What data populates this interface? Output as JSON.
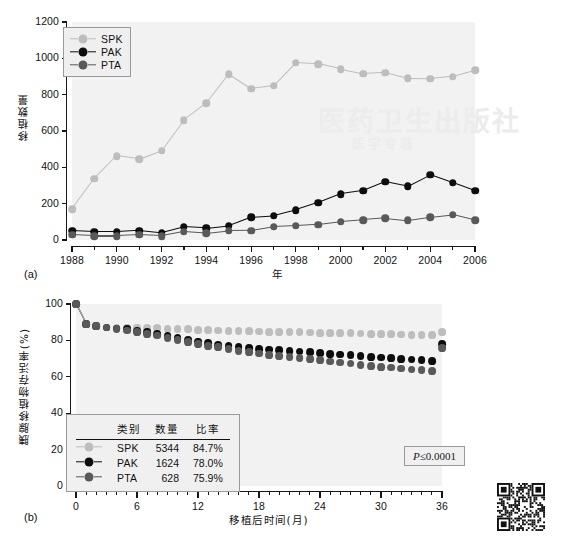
{
  "figure": {
    "panel_a_letter": "(a)",
    "panel_b_letter": "(b)",
    "watermark_primary": "医药卫生出版社",
    "watermark_secondary": "医学专著"
  },
  "colors": {
    "spk": "#bdbdbd",
    "pak": "#0d0d0d",
    "pta": "#595959",
    "plot_bg": "#f2f2f2",
    "axis": "#161616",
    "page_bg": "#ffffff"
  },
  "chart_data": [
    {
      "type": "line",
      "panel": "(a)",
      "title": "",
      "xlabel": "年",
      "ylabel": "移植数量",
      "xlim": [
        1988,
        2006
      ],
      "ylim": [
        0,
        1200
      ],
      "grid": false,
      "legend_position": "top-left",
      "x": [
        1988,
        1989,
        1990,
        1991,
        1992,
        1993,
        1994,
        1995,
        1996,
        1997,
        1998,
        1999,
        2000,
        2001,
        2002,
        2003,
        2004,
        2005,
        2006
      ],
      "xticklabels": [
        "1988",
        "1990",
        "1992",
        "1994",
        "1996",
        "1998",
        "2000",
        "2002",
        "2004",
        "2006"
      ],
      "xtickvalues": [
        1988,
        1990,
        1992,
        1994,
        1996,
        1998,
        2000,
        2002,
        2004,
        2006
      ],
      "yticklabels": [
        "0",
        "200",
        "400",
        "600",
        "800",
        "1000",
        "1200"
      ],
      "ytickvalues": [
        0,
        200,
        400,
        600,
        800,
        1000,
        1200
      ],
      "series": [
        {
          "name": "SPK",
          "color": "#bdbdbd",
          "values": [
            170,
            337,
            462,
            445,
            492,
            660,
            752,
            912,
            832,
            848,
            975,
            968,
            940,
            915,
            922,
            890,
            888,
            900,
            935
          ]
        },
        {
          "name": "PAK",
          "color": "#0d0d0d",
          "values": [
            50,
            45,
            45,
            52,
            40,
            72,
            65,
            78,
            125,
            133,
            165,
            205,
            253,
            270,
            320,
            295,
            358,
            315,
            270
          ]
        },
        {
          "name": "PTA",
          "color": "#595959",
          "values": [
            28,
            22,
            22,
            28,
            22,
            45,
            37,
            50,
            52,
            73,
            78,
            85,
            100,
            110,
            120,
            108,
            125,
            138,
            108
          ]
        }
      ]
    },
    {
      "type": "line",
      "panel": "(b)",
      "title": "",
      "xlabel": "移植后时间(月)",
      "ylabel": "胰腺移植物存活率(%)",
      "xlim": [
        0,
        36
      ],
      "ylim": [
        0,
        100
      ],
      "grid": false,
      "legend_position": "lower-left",
      "annotation": "P≤0.0001",
      "xticklabels": [
        "0",
        "6",
        "12",
        "18",
        "24",
        "30",
        "36"
      ],
      "xtickvalues": [
        0,
        6,
        12,
        18,
        24,
        30,
        36
      ],
      "yticklabels": [
        "0",
        "20",
        "40",
        "60",
        "80",
        "100"
      ],
      "ytickvalues": [
        0,
        20,
        40,
        60,
        80,
        100
      ],
      "x": [
        0,
        1,
        2,
        3,
        4,
        5,
        6,
        7,
        8,
        9,
        10,
        11,
        12,
        13,
        14,
        15,
        16,
        17,
        18,
        19,
        20,
        21,
        22,
        23,
        24,
        25,
        26,
        27,
        28,
        29,
        30,
        31,
        32,
        33,
        34,
        35,
        36
      ],
      "series": [
        {
          "name": "SPK",
          "color": "#bdbdbd",
          "n": 5344,
          "rate_36m": "84.7%",
          "values": [
            100,
            89,
            88,
            87,
            87,
            87,
            87,
            86.8,
            86.6,
            86.4,
            86.2,
            86,
            85.8,
            85.6,
            85.4,
            85.2,
            85,
            85,
            84.8,
            84.7,
            84.6,
            84.5,
            84.4,
            84.3,
            84.2,
            84,
            83.9,
            83.8,
            83.7,
            83.6,
            83.5,
            83.3,
            83.2,
            83,
            82.9,
            82.8,
            84.7
          ]
        },
        {
          "name": "PAK",
          "color": "#0d0d0d",
          "n": 1624,
          "rate_36m": "78.0%",
          "values": [
            100,
            89,
            88,
            87,
            86.5,
            86,
            85.3,
            84.5,
            83.5,
            82.5,
            81.3,
            80.2,
            79.3,
            78.4,
            77.6,
            77,
            76.4,
            75.9,
            75.4,
            75,
            74.6,
            74.2,
            73.8,
            73.4,
            73,
            72.6,
            72.2,
            71.8,
            71.4,
            71,
            70.6,
            70.2,
            69.8,
            69.4,
            69,
            68.6,
            78.0
          ]
        },
        {
          "name": "PTA",
          "color": "#595959",
          "n": 628,
          "rate_36m": "75.9%",
          "values": [
            100,
            89,
            88,
            87,
            86,
            85.4,
            84.6,
            83.6,
            82.6,
            81.4,
            80.2,
            79,
            77.9,
            77,
            76.2,
            75.2,
            74.3,
            73.5,
            72.8,
            72.1,
            71.4,
            70.8,
            70.2,
            69.6,
            69,
            68.4,
            67.8,
            67.2,
            66.6,
            66,
            65.5,
            65,
            64.5,
            64,
            63.5,
            63,
            75.9
          ]
        }
      ]
    }
  ],
  "panel_a_legend": {
    "items": [
      {
        "label": "SPK",
        "color": "#bdbdbd"
      },
      {
        "label": "PAK",
        "color": "#0d0d0d"
      },
      {
        "label": "PTA",
        "color": "#595959"
      }
    ]
  },
  "panel_b_legend": {
    "headers": [
      "类别",
      "数量",
      "比率"
    ],
    "rows": [
      {
        "label": "SPK",
        "count": "5344",
        "rate": "84.7%",
        "color": "#bdbdbd"
      },
      {
        "label": "PAK",
        "count": "1624",
        "rate": "78.0%",
        "color": "#0d0d0d"
      },
      {
        "label": "PTA",
        "count": "628",
        "rate": "75.9%",
        "color": "#595959"
      }
    ]
  },
  "panel_b_pvalue": {
    "italic": "P",
    "rest": "≤0.0001"
  }
}
